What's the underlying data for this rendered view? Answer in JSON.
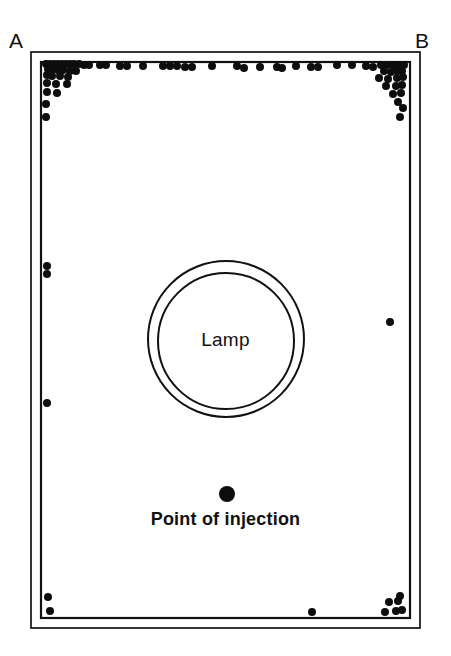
{
  "figure": {
    "type": "scatter",
    "corner_labels": {
      "left": "A",
      "right": "B"
    },
    "lamp_label": "Lamp",
    "injection_label": "Point of injection",
    "colors": {
      "ink": "#111111",
      "dot": "#0d0d0d",
      "background": "#ffffff"
    }
  },
  "chart_data": {
    "type": "scatter",
    "title": "",
    "xlabel": "",
    "ylabel": "",
    "grid": false,
    "legend": "none",
    "xlim": [
      0,
      451
    ],
    "ylim": [
      0,
      656
    ],
    "annotations": [
      {
        "text": "A",
        "x": 16,
        "y": 42
      },
      {
        "text": "B",
        "x": 422,
        "y": 42
      },
      {
        "text": "Lamp",
        "x": 226,
        "y": 340
      },
      {
        "text": "Point of injection",
        "x": 226,
        "y": 520
      }
    ],
    "shapes": [
      {
        "name": "outer-frame",
        "type": "rect",
        "x": 31,
        "y": 52,
        "width": 389,
        "height": 576
      },
      {
        "name": "inner-frame",
        "type": "rect",
        "x": 41,
        "y": 62,
        "width": 369,
        "height": 556
      },
      {
        "name": "lamp-outer-circle",
        "type": "circle",
        "cx": 226,
        "cy": 339,
        "r": 78
      },
      {
        "name": "lamp-inner-circle",
        "type": "circle",
        "cx": 226,
        "cy": 341,
        "r": 68
      },
      {
        "name": "injection-point",
        "type": "dot",
        "cx": 227,
        "cy": 494,
        "r": 8
      }
    ],
    "series": [
      {
        "name": "specimen positions",
        "marker": "filled-circle",
        "marker_radius": 4,
        "points": [
          [
            46,
            64
          ],
          [
            50,
            64
          ],
          [
            54,
            64
          ],
          [
            58,
            64
          ],
          [
            62,
            64
          ],
          [
            66,
            64
          ],
          [
            70,
            64
          ],
          [
            74,
            64
          ],
          [
            79,
            64
          ],
          [
            84,
            65
          ],
          [
            89,
            65
          ],
          [
            48,
            69
          ],
          [
            53,
            69
          ],
          [
            58,
            70
          ],
          [
            63,
            70
          ],
          [
            70,
            71
          ],
          [
            76,
            71
          ],
          [
            47,
            75
          ],
          [
            52,
            76
          ],
          [
            60,
            76
          ],
          [
            68,
            77
          ],
          [
            47,
            83
          ],
          [
            56,
            84
          ],
          [
            67,
            84
          ],
          [
            47,
            92
          ],
          [
            57,
            93
          ],
          [
            46,
            104
          ],
          [
            46,
            117
          ],
          [
            100,
            65
          ],
          [
            106,
            65
          ],
          [
            120,
            66
          ],
          [
            127,
            66
          ],
          [
            143,
            66
          ],
          [
            163,
            66
          ],
          [
            170,
            66
          ],
          [
            177,
            66
          ],
          [
            185,
            67
          ],
          [
            192,
            67
          ],
          [
            212,
            66
          ],
          [
            237,
            66
          ],
          [
            244,
            68
          ],
          [
            260,
            67
          ],
          [
            277,
            67
          ],
          [
            282,
            68
          ],
          [
            296,
            66
          ],
          [
            311,
            67
          ],
          [
            318,
            67
          ],
          [
            337,
            65
          ],
          [
            352,
            65
          ],
          [
            366,
            66
          ],
          [
            373,
            67
          ],
          [
            381,
            65
          ],
          [
            387,
            65
          ],
          [
            393,
            65
          ],
          [
            399,
            65
          ],
          [
            404,
            65
          ],
          [
            384,
            71
          ],
          [
            391,
            72
          ],
          [
            397,
            71
          ],
          [
            402,
            71
          ],
          [
            379,
            78
          ],
          [
            388,
            79
          ],
          [
            397,
            78
          ],
          [
            403,
            77
          ],
          [
            386,
            86
          ],
          [
            396,
            86
          ],
          [
            402,
            85
          ],
          [
            393,
            94
          ],
          [
            401,
            93
          ],
          [
            398,
            102
          ],
          [
            403,
            108
          ],
          [
            400,
            117
          ],
          [
            47,
            266
          ],
          [
            47,
            274
          ],
          [
            47,
            403
          ],
          [
            390,
            322
          ],
          [
            48,
            597
          ],
          [
            50,
            611
          ],
          [
            312,
            612
          ],
          [
            389,
            602
          ],
          [
            398,
            601
          ],
          [
            385,
            612
          ],
          [
            396,
            611
          ],
          [
            402,
            610
          ],
          [
            400,
            596
          ]
        ]
      }
    ]
  }
}
